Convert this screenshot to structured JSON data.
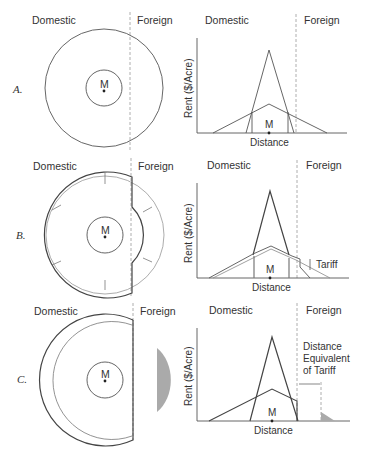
{
  "panels": [
    {
      "letter": "A.",
      "domestic": "Domestic",
      "foreign": "Foreign",
      "market": "M",
      "ylabel": "Rent  ($/Acre)",
      "xlabel": "Distance",
      "annotation": ""
    },
    {
      "letter": "B.",
      "domestic": "Domestic",
      "foreign": "Foreign",
      "market": "M",
      "ylabel": "Rent  ($/Acre)",
      "xlabel": "Distance",
      "annotation": "Tariff"
    },
    {
      "letter": "C.",
      "domestic": "Domestic",
      "foreign": "Foreign",
      "market": "M",
      "ylabel": "Rent  ($/Acre)",
      "xlabel": "Distance",
      "annotation_lines": [
        "Distance",
        "Equivalent",
        "of Tariff"
      ]
    }
  ],
  "colors": {
    "line": "#555555",
    "shade": "#aaaaaa",
    "border": "#999999"
  }
}
